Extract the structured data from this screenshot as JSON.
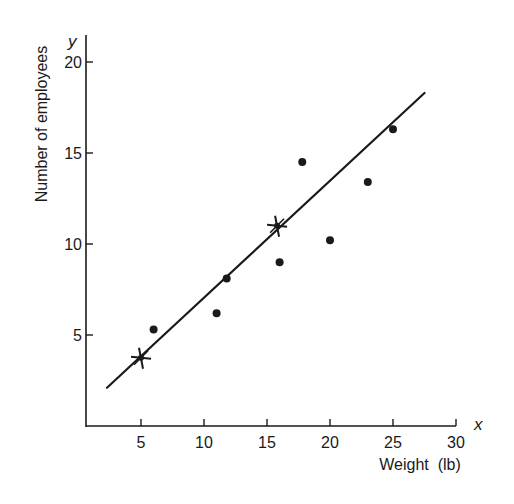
{
  "chart_data": {
    "type": "scatter",
    "title": "",
    "xlabel": "Weight  (lb)",
    "ylabel": "Number of employees",
    "x_axis_symbol": "x",
    "y_axis_symbol": "y",
    "xlim": [
      0,
      30
    ],
    "ylim": [
      0,
      21
    ],
    "xticks": [
      5,
      10,
      15,
      20,
      25,
      30
    ],
    "yticks": [
      5,
      10,
      15,
      20
    ],
    "grid": false,
    "legend": null,
    "series": [
      {
        "name": "observations",
        "marker": "dot",
        "points": [
          {
            "x": 6,
            "y": 5.3
          },
          {
            "x": 11,
            "y": 6.2
          },
          {
            "x": 11.8,
            "y": 8.1
          },
          {
            "x": 16,
            "y": 9
          },
          {
            "x": 17.8,
            "y": 14.5
          },
          {
            "x": 20,
            "y": 10.2
          },
          {
            "x": 23,
            "y": 13.4
          },
          {
            "x": 25,
            "y": 16.3
          }
        ]
      },
      {
        "name": "fitted-line-anchor-points",
        "marker": "star",
        "points": [
          {
            "x": 5,
            "y": 3.75
          },
          {
            "x": 15.8,
            "y": 11
          }
        ]
      },
      {
        "name": "regression-line",
        "type": "line",
        "points": [
          {
            "x": 2.3,
            "y": 2.1
          },
          {
            "x": 27.5,
            "y": 18.3
          }
        ]
      }
    ]
  },
  "layout": {
    "x_origin_px": 78,
    "x_scale_px": 12.6,
    "y_origin_px": 426,
    "y_scale_px": 18.2,
    "axis_left_px": 86,
    "axis_top_px": 35,
    "axis_right_x_value": 30,
    "ink_color": "#1a1a1a"
  }
}
